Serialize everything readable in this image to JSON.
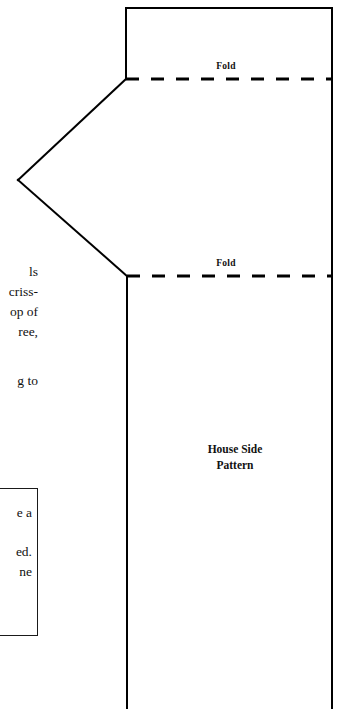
{
  "page": {
    "background_color": "#ffffff",
    "ink_color": "#111111",
    "width": 347,
    "height": 709
  },
  "left_column": {
    "fragment_lines_top": [
      "ls",
      "criss-",
      "op of",
      "ree,"
    ],
    "fragment_lines_bottom": [
      "g to"
    ]
  },
  "note_box": {
    "border_color": "#1a1a1a",
    "fragment_lines": [
      "e a",
      "",
      "ed.",
      "ne"
    ]
  },
  "pattern": {
    "caption_line_1": "House Side",
    "caption_line_2": "Pattern",
    "fold_label_top": "Fold",
    "fold_label_bottom": "Fold",
    "outline_color": "#000000",
    "outline_width": 2,
    "fold_line_color": "#000000",
    "fold_line_width": 3,
    "fold_dash_pattern": "13 12",
    "vertices": {
      "top_left_corner": [
        126,
        8
      ],
      "top_right_corner": [
        332,
        8
      ],
      "upper_gable_vertex": [
        126,
        79
      ],
      "peak_apex": [
        18,
        180
      ],
      "lower_gable_vertex": [
        127,
        276
      ],
      "left_edge_bottom": [
        127,
        709
      ],
      "right_edge_bottom": [
        332,
        709
      ]
    },
    "fold_lines": [
      {
        "label": "Fold",
        "y": 79,
        "x_start": 126,
        "x_end": 332
      },
      {
        "label": "Fold",
        "y": 276,
        "x_start": 127,
        "x_end": 332
      }
    ]
  }
}
